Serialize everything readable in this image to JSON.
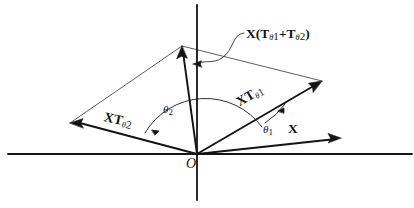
{
  "figure": {
    "kind": "vector-addition-diagram",
    "background": "#ffffff",
    "ink": "#141414",
    "origin_label": "O",
    "labels": {
      "resultant_prefix": "X",
      "resultant_open": "(T",
      "resultant_sub1": "θ",
      "resultant_sub1_index": "1",
      "resultant_plus": "+T",
      "resultant_sub2": "θ",
      "resultant_sub2_index": "2",
      "resultant_close": ")",
      "vector_xt1_main": "XT",
      "vector_xt1_sub": "θ",
      "vector_xt1_index": "1",
      "vector_xt2_main": "XT",
      "vector_xt2_sub": "θ",
      "vector_xt2_index": "2",
      "vector_x": "X",
      "angle_1": "θ",
      "angle_1_index": "1",
      "angle_2": "θ",
      "angle_2_index": "2"
    },
    "geometry": {
      "origin": [
        197,
        154
      ],
      "x_axis": [
        8,
        154,
        412,
        154
      ],
      "y_axis": [
        197,
        5,
        197,
        200
      ],
      "vector_x_tip": [
        341,
        138
      ],
      "vector_xt1_tip": [
        322,
        81
      ],
      "vector_xt2_tip": [
        70,
        123
      ],
      "resultant_tip": [
        182,
        46
      ],
      "angle_arc_1_radius": 74,
      "angle_arc_2_radius": 58
    }
  }
}
